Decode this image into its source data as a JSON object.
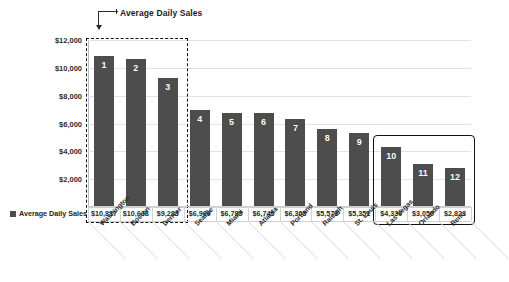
{
  "annotation": {
    "label": "Average Daily Sales",
    "leader_icon": "callout-leader-icon"
  },
  "legend": {
    "label": "Average Daily Sales",
    "swatch_color": "#4d4d4d"
  },
  "axis": {
    "y_ticks": [
      "$12,000",
      "$10,000",
      "$8,000",
      "$6,000",
      "$4,000",
      "$2,000"
    ]
  },
  "highlight": {
    "top_group_style": "dashed",
    "bottom_group_style": "solid",
    "top_group_range": [
      1,
      3
    ],
    "bottom_group_range": [
      10,
      12
    ]
  },
  "chart_data": {
    "type": "bar",
    "title": "Average Daily Sales",
    "xlabel": "",
    "ylabel": "",
    "ylim": [
      0,
      12000
    ],
    "ytick_step": 2000,
    "grid": true,
    "legend_position": "bottom-left",
    "bar_color": "#4d4d4d",
    "categories": [
      "Washington",
      "Boston",
      "Denver",
      "Seattle",
      "Miami",
      "Atlanta",
      "Portland",
      "Raleigh",
      "St. Louis",
      "Las Vegas",
      "Orlando",
      "Reno"
    ],
    "values": [
      10837,
      10638,
      9283,
      6969,
      6785,
      6745,
      6305,
      5573,
      5351,
      4330,
      3059,
      2823
    ],
    "value_labels": [
      "$10,837",
      "$10,638",
      "$9,283",
      "$6,969",
      "$6,785",
      "$6,745",
      "$6,305",
      "$5,573",
      "$5,351",
      "$4,330",
      "$3,059",
      "$2,823"
    ],
    "ranks": [
      "1",
      "2",
      "3",
      "4",
      "5",
      "6",
      "7",
      "8",
      "9",
      "10",
      "11",
      "12"
    ],
    "series": [
      {
        "name": "Average Daily Sales",
        "values": [
          10837,
          10638,
          9283,
          6969,
          6785,
          6745,
          6305,
          5573,
          5351,
          4330,
          3059,
          2823
        ]
      }
    ]
  }
}
